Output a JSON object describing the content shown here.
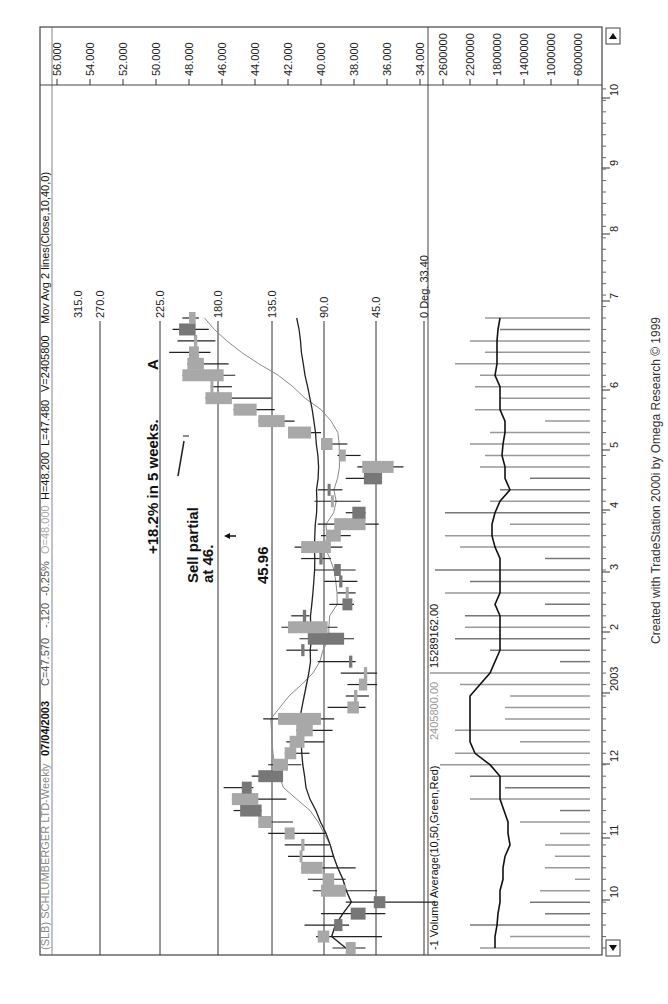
{
  "header": {
    "symbol": "(SLB) SCHLUMBERGER LTD-Weekly",
    "date": "07/04/2003",
    "close": "C=47.570",
    "change": "-.120",
    "change_pct": "-0.25%",
    "open": "O=48.000",
    "high": "H=48.200",
    "low": "L=47.480",
    "volume": "V=2405800",
    "indicator": "Mov Avg 2 lines(Close,10,40,0)"
  },
  "volume_header": {
    "label": "-1 Volume Average(10,50,Green,Red)",
    "value1": "2405800.00",
    "value2": "15289162.00"
  },
  "annotations": {
    "gain": "+18.2% in 5 weeks.",
    "marker_a": "A",
    "sell_line1": "Sell partial",
    "sell_line2": "at 46.",
    "price_note": "45.96"
  },
  "footer": {
    "credit": "Created with TradeStation 2000i by Omega Research © 1999"
  },
  "colors": {
    "up_body": "#a8a8a8",
    "down_body": "#777777",
    "grid": "#333333",
    "ma_fast": "#8a8a8a",
    "ma_slow": "#222222"
  },
  "chart_data": [
    {
      "type": "candlestick",
      "title": "(SLB) SCHLUMBERGER LTD-Weekly",
      "ylabel": "Price",
      "ylim": [
        33.4,
        57
      ],
      "price_ticks": [
        "56.000",
        "54.000",
        "52.000",
        "50.000",
        "48.000",
        "46.000",
        "44.000",
        "42.000",
        "40.000",
        "38.000",
        "36.000",
        "34.000"
      ],
      "x_ticks": [
        "10",
        "11",
        "12",
        "2003",
        "2",
        "3",
        "4",
        "5",
        "6",
        "7",
        "8",
        "9",
        "10"
      ],
      "angle_lines": [
        "315.0",
        "270.0",
        "225.0",
        "180.0",
        "135.0",
        "90.0",
        "45.0",
        "0 Deg. 33.40"
      ],
      "series": [
        {
          "name": "Mov Avg fast (10)",
          "type": "line"
        },
        {
          "name": "Mov Avg slow (40)",
          "type": "line"
        }
      ],
      "bars": [
        {
          "o": 37.9,
          "h": 39.3,
          "l": 37.3,
          "c": 38.5
        },
        {
          "o": 39.5,
          "h": 40.3,
          "l": 36.3,
          "c": 40.2
        },
        {
          "o": 39.2,
          "h": 41.0,
          "l": 38.3,
          "c": 38.7
        },
        {
          "o": 38.2,
          "h": 40.0,
          "l": 36.1,
          "c": 37.3
        },
        {
          "o": 36.8,
          "h": 38.5,
          "l": 33.0,
          "c": 36.1
        },
        {
          "o": 38.5,
          "h": 40.5,
          "l": 36.6,
          "c": 40.0
        },
        {
          "o": 39.2,
          "h": 40.8,
          "l": 38.5,
          "c": 39.9
        },
        {
          "o": 39.9,
          "h": 41.0,
          "l": 37.9,
          "c": 41.2
        },
        {
          "o": 41.2,
          "h": 42.0,
          "l": 39.2,
          "c": 41.3
        },
        {
          "o": 41.0,
          "h": 42.2,
          "l": 39.5,
          "c": 41.2
        },
        {
          "o": 41.6,
          "h": 43.2,
          "l": 39.7,
          "c": 42.2
        },
        {
          "o": 43.0,
          "h": 43.8,
          "l": 41.7,
          "c": 43.8
        },
        {
          "o": 44.9,
          "h": 45.3,
          "l": 44.2,
          "c": 43.6
        },
        {
          "o": 43.8,
          "h": 45.2,
          "l": 42.1,
          "c": 45.4
        },
        {
          "o": 44.8,
          "h": 45.9,
          "l": 44.1,
          "c": 44.2
        },
        {
          "o": 43.8,
          "h": 44.2,
          "l": 42.6,
          "c": 42.3
        },
        {
          "o": 42.0,
          "h": 43.2,
          "l": 41.2,
          "c": 42.9
        },
        {
          "o": 41.5,
          "h": 42.1,
          "l": 40.7,
          "c": 42.2
        },
        {
          "o": 41.0,
          "h": 42.1,
          "l": 39.8,
          "c": 41.9
        },
        {
          "o": 40.5,
          "h": 41.5,
          "l": 39.3,
          "c": 41.5
        },
        {
          "o": 40.0,
          "h": 43.5,
          "l": 39.2,
          "c": 42.6
        },
        {
          "o": 37.7,
          "h": 39.6,
          "l": 37.3,
          "c": 38.4
        },
        {
          "o": 37.8,
          "h": 38.5,
          "l": 37.1,
          "c": 38.0
        },
        {
          "o": 37.2,
          "h": 38.4,
          "l": 36.6,
          "c": 37.7
        },
        {
          "o": 37.2,
          "h": 38.8,
          "l": 36.6,
          "c": 37.4
        },
        {
          "o": 38.3,
          "h": 40.2,
          "l": 37.9,
          "c": 38.1
        },
        {
          "o": 41.2,
          "h": 42.1,
          "l": 40.2,
          "c": 41.0
        },
        {
          "o": 40.8,
          "h": 41.3,
          "l": 38.0,
          "c": 38.6
        },
        {
          "o": 39.6,
          "h": 42.4,
          "l": 39.0,
          "c": 42.0
        },
        {
          "o": 41.1,
          "h": 41.8,
          "l": 40.7,
          "c": 40.9
        },
        {
          "o": 38.7,
          "h": 39.5,
          "l": 38.0,
          "c": 38.1
        },
        {
          "o": 38.4,
          "h": 39.0,
          "l": 37.9,
          "c": 38.5
        },
        {
          "o": 38.9,
          "h": 39.8,
          "l": 37.8,
          "c": 38.7
        },
        {
          "o": 39.2,
          "h": 40.4,
          "l": 37.9,
          "c": 38.8
        },
        {
          "o": 40.1,
          "h": 41.2,
          "l": 39.4,
          "c": 39.9
        },
        {
          "o": 39.4,
          "h": 41.6,
          "l": 38.7,
          "c": 41.2
        },
        {
          "o": 38.8,
          "h": 40.0,
          "l": 38.2,
          "c": 39.7
        },
        {
          "o": 37.3,
          "h": 40.2,
          "l": 36.5,
          "c": 39.2
        },
        {
          "o": 38.1,
          "h": 38.5,
          "l": 37.6,
          "c": 37.3
        },
        {
          "o": 39.3,
          "h": 40.4,
          "l": 37.6,
          "c": 39.4
        },
        {
          "o": 39.6,
          "h": 40.2,
          "l": 38.7,
          "c": 39.5
        },
        {
          "o": 37.4,
          "h": 38.5,
          "l": 36.9,
          "c": 36.3
        },
        {
          "o": 35.6,
          "h": 37.8,
          "l": 35.0,
          "c": 37.5
        },
        {
          "o": 38.5,
          "h": 39.0,
          "l": 37.6,
          "c": 38.9
        },
        {
          "o": 39.3,
          "h": 39.9,
          "l": 38.4,
          "c": 40.0
        },
        {
          "o": 40.6,
          "h": 41.5,
          "l": 40.0,
          "c": 42.0
        },
        {
          "o": 42.2,
          "h": 43.1,
          "l": 41.6,
          "c": 43.8
        },
        {
          "o": 43.9,
          "h": 44.4,
          "l": 42.8,
          "c": 45.3
        },
        {
          "o": 45.4,
          "h": 46.3,
          "l": 43.0,
          "c": 47.0
        },
        {
          "o": 46.7,
          "h": 46.2,
          "l": 45.4,
          "c": 46.7
        },
        {
          "o": 45.9,
          "h": 46.5,
          "l": 45.2,
          "c": 48.4
        },
        {
          "o": 47.1,
          "h": 48.0,
          "l": 45.6,
          "c": 48.1
        },
        {
          "o": 47.4,
          "h": 49.2,
          "l": 46.7,
          "c": 48.0
        },
        {
          "o": 47.5,
          "h": 48.7,
          "l": 46.4,
          "c": 47.7
        },
        {
          "o": 48.6,
          "h": 49.0,
          "l": 46.8,
          "c": 47.6
        },
        {
          "o": 47.6,
          "h": 48.4,
          "l": 47.4,
          "c": 48.0
        }
      ]
    },
    {
      "type": "bar",
      "title": "-1 Volume Average(10,50,Green,Red)",
      "ylabel": "Volume",
      "y_ticks": [
        "2600000",
        "2200000",
        "1800000",
        "1400000",
        "1000000",
        "6000000"
      ]
    }
  ]
}
